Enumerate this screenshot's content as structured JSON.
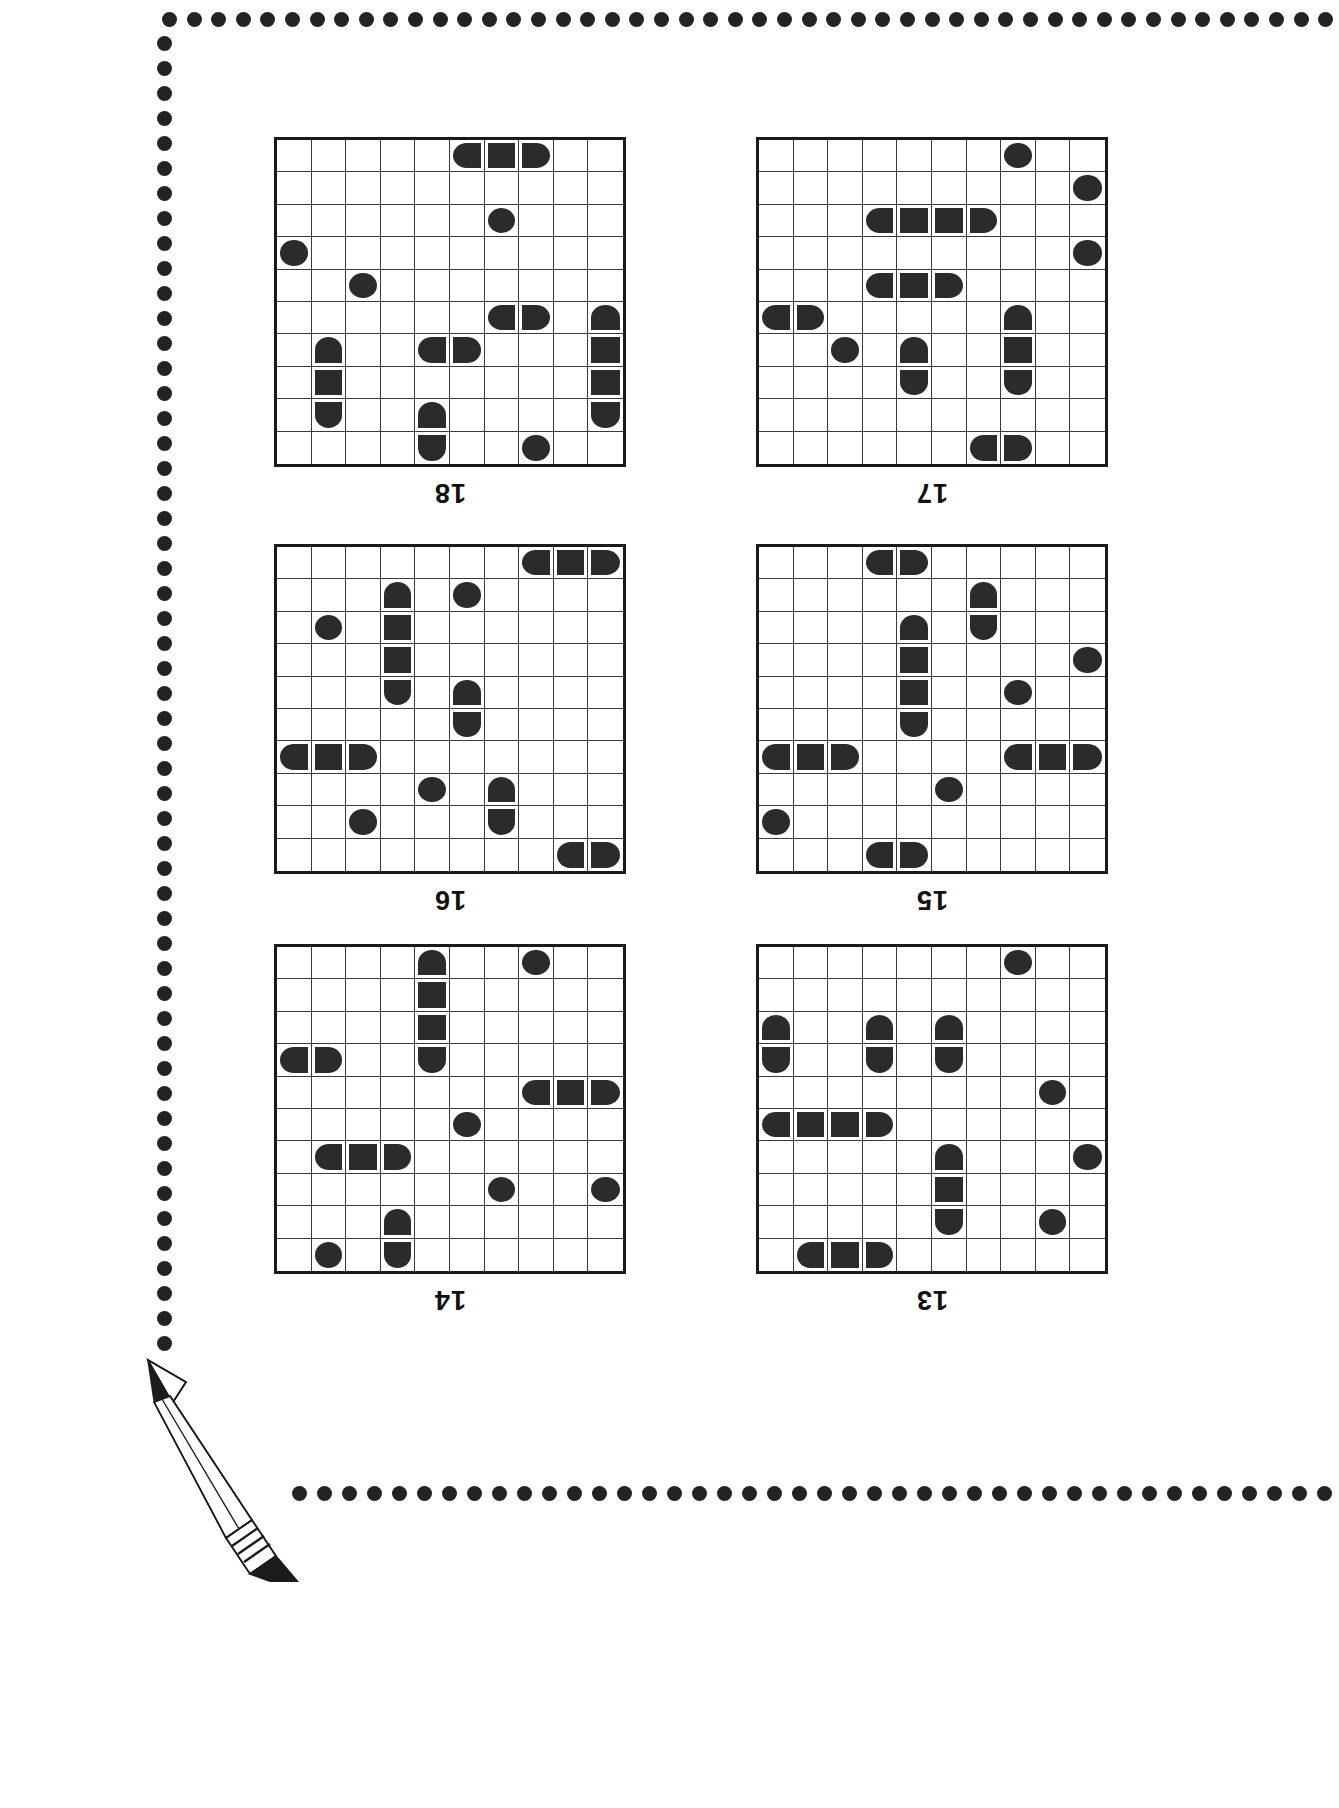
{
  "page": {
    "type": "battleship-puzzle-worksheet",
    "background_color": "#ffffff",
    "ink_color": "#2b2b2b",
    "border_style": "dotted-circles",
    "border_dot_color": "#232323",
    "decoration": "pencil-illustration-bottom-left",
    "grid_columns": 10,
    "grid_rows": 10,
    "labels_rotated_180": true
  },
  "puzzles": [
    {
      "id": "puzzle-18",
      "label": "18",
      "position": "top-left",
      "ships": [
        {
          "cells": [
            [
              0,
              5
            ],
            [
              0,
              6
            ],
            [
              0,
              7
            ]
          ],
          "orientation": "horizontal",
          "size": 3
        },
        {
          "cells": [
            [
              2,
              6
            ]
          ],
          "orientation": "single",
          "size": 1
        },
        {
          "cells": [
            [
              3,
              0
            ]
          ],
          "orientation": "single",
          "size": 1
        },
        {
          "cells": [
            [
              4,
              2
            ]
          ],
          "orientation": "single",
          "size": 1
        },
        {
          "cells": [
            [
              5,
              6
            ],
            [
              5,
              7
            ]
          ],
          "orientation": "horizontal",
          "size": 2
        },
        {
          "cells": [
            [
              5,
              9
            ],
            [
              6,
              9
            ],
            [
              7,
              9
            ],
            [
              8,
              9
            ]
          ],
          "orientation": "vertical",
          "size": 4
        },
        {
          "cells": [
            [
              6,
              1
            ],
            [
              7,
              1
            ],
            [
              8,
              1
            ]
          ],
          "orientation": "vertical",
          "size": 3
        },
        {
          "cells": [
            [
              6,
              4
            ],
            [
              6,
              5
            ]
          ],
          "orientation": "horizontal",
          "size": 2
        },
        {
          "cells": [
            [
              8,
              4
            ],
            [
              9,
              4
            ]
          ],
          "orientation": "vertical",
          "size": 2
        },
        {
          "cells": [
            [
              9,
              7
            ]
          ],
          "orientation": "single",
          "size": 1
        }
      ]
    },
    {
      "id": "puzzle-17",
      "label": "17",
      "position": "top-right",
      "ships": [
        {
          "cells": [
            [
              0,
              7
            ]
          ],
          "orientation": "single",
          "size": 1
        },
        {
          "cells": [
            [
              1,
              9
            ]
          ],
          "orientation": "single",
          "size": 1
        },
        {
          "cells": [
            [
              2,
              3
            ],
            [
              2,
              4
            ],
            [
              2,
              5
            ],
            [
              2,
              6
            ]
          ],
          "orientation": "horizontal",
          "size": 4
        },
        {
          "cells": [
            [
              3,
              9
            ]
          ],
          "orientation": "single",
          "size": 1
        },
        {
          "cells": [
            [
              4,
              3
            ],
            [
              4,
              4
            ],
            [
              4,
              5
            ]
          ],
          "orientation": "horizontal",
          "size": 3
        },
        {
          "cells": [
            [
              5,
              0
            ],
            [
              5,
              1
            ]
          ],
          "orientation": "horizontal",
          "size": 2
        },
        {
          "cells": [
            [
              5,
              7
            ],
            [
              6,
              7
            ],
            [
              7,
              7
            ]
          ],
          "orientation": "vertical",
          "size": 3
        },
        {
          "cells": [
            [
              6,
              2
            ]
          ],
          "orientation": "single",
          "size": 1
        },
        {
          "cells": [
            [
              6,
              4
            ],
            [
              7,
              4
            ]
          ],
          "orientation": "vertical",
          "size": 2
        },
        {
          "cells": [
            [
              9,
              6
            ],
            [
              9,
              7
            ]
          ],
          "orientation": "horizontal",
          "size": 2
        }
      ]
    },
    {
      "id": "puzzle-16",
      "label": "16",
      "position": "middle-left",
      "ships": [
        {
          "cells": [
            [
              0,
              7
            ],
            [
              0,
              8
            ],
            [
              0,
              9
            ]
          ],
          "orientation": "horizontal",
          "size": 3
        },
        {
          "cells": [
            [
              1,
              3
            ],
            [
              2,
              3
            ],
            [
              3,
              3
            ],
            [
              4,
              3
            ]
          ],
          "orientation": "vertical",
          "size": 4
        },
        {
          "cells": [
            [
              1,
              5
            ]
          ],
          "orientation": "single",
          "size": 1
        },
        {
          "cells": [
            [
              2,
              1
            ]
          ],
          "orientation": "single",
          "size": 1
        },
        {
          "cells": [
            [
              4,
              5
            ],
            [
              5,
              5
            ]
          ],
          "orientation": "vertical",
          "size": 2
        },
        {
          "cells": [
            [
              6,
              0
            ],
            [
              6,
              1
            ],
            [
              6,
              2
            ]
          ],
          "orientation": "horizontal",
          "size": 3
        },
        {
          "cells": [
            [
              7,
              4
            ]
          ],
          "orientation": "single",
          "size": 1
        },
        {
          "cells": [
            [
              7,
              6
            ],
            [
              8,
              6
            ]
          ],
          "orientation": "vertical",
          "size": 2
        },
        {
          "cells": [
            [
              8,
              2
            ]
          ],
          "orientation": "single",
          "size": 1
        },
        {
          "cells": [
            [
              9,
              8
            ],
            [
              9,
              9
            ]
          ],
          "orientation": "horizontal",
          "size": 2
        }
      ]
    },
    {
      "id": "puzzle-15",
      "label": "15",
      "position": "middle-right",
      "ships": [
        {
          "cells": [
            [
              0,
              3
            ],
            [
              0,
              4
            ]
          ],
          "orientation": "horizontal",
          "size": 2
        },
        {
          "cells": [
            [
              1,
              6
            ],
            [
              2,
              6
            ]
          ],
          "orientation": "vertical",
          "size": 2
        },
        {
          "cells": [
            [
              2,
              4
            ],
            [
              3,
              4
            ],
            [
              4,
              4
            ],
            [
              5,
              4
            ]
          ],
          "orientation": "vertical",
          "size": 4
        },
        {
          "cells": [
            [
              3,
              9
            ]
          ],
          "orientation": "single",
          "size": 1
        },
        {
          "cells": [
            [
              4,
              7
            ]
          ],
          "orientation": "single",
          "size": 1
        },
        {
          "cells": [
            [
              6,
              0
            ],
            [
              6,
              1
            ],
            [
              6,
              2
            ]
          ],
          "orientation": "horizontal",
          "size": 3
        },
        {
          "cells": [
            [
              6,
              7
            ],
            [
              6,
              8
            ],
            [
              6,
              9
            ]
          ],
          "orientation": "horizontal",
          "size": 3
        },
        {
          "cells": [
            [
              7,
              5
            ]
          ],
          "orientation": "single",
          "size": 1
        },
        {
          "cells": [
            [
              8,
              0
            ]
          ],
          "orientation": "single",
          "size": 1
        },
        {
          "cells": [
            [
              9,
              3
            ],
            [
              9,
              4
            ]
          ],
          "orientation": "horizontal",
          "size": 2
        }
      ]
    },
    {
      "id": "puzzle-14",
      "label": "14",
      "position": "bottom-left",
      "ships": [
        {
          "cells": [
            [
              0,
              4
            ],
            [
              1,
              4
            ],
            [
              2,
              4
            ],
            [
              3,
              4
            ]
          ],
          "orientation": "vertical",
          "size": 4
        },
        {
          "cells": [
            [
              0,
              7
            ]
          ],
          "orientation": "single",
          "size": 1
        },
        {
          "cells": [
            [
              3,
              0
            ],
            [
              3,
              1
            ]
          ],
          "orientation": "horizontal",
          "size": 2
        },
        {
          "cells": [
            [
              4,
              7
            ],
            [
              4,
              8
            ],
            [
              4,
              9
            ]
          ],
          "orientation": "horizontal",
          "size": 3
        },
        {
          "cells": [
            [
              5,
              5
            ]
          ],
          "orientation": "single",
          "size": 1
        },
        {
          "cells": [
            [
              6,
              1
            ],
            [
              6,
              2
            ],
            [
              6,
              3
            ]
          ],
          "orientation": "horizontal",
          "size": 3
        },
        {
          "cells": [
            [
              7,
              6
            ]
          ],
          "orientation": "single",
          "size": 1
        },
        {
          "cells": [
            [
              7,
              9
            ]
          ],
          "orientation": "single",
          "size": 1
        },
        {
          "cells": [
            [
              8,
              3
            ],
            [
              9,
              3
            ]
          ],
          "orientation": "vertical",
          "size": 2
        },
        {
          "cells": [
            [
              9,
              1
            ]
          ],
          "orientation": "single",
          "size": 1
        }
      ]
    },
    {
      "id": "puzzle-13",
      "label": "13",
      "position": "bottom-right",
      "ships": [
        {
          "cells": [
            [
              0,
              7
            ]
          ],
          "orientation": "single",
          "size": 1
        },
        {
          "cells": [
            [
              2,
              0
            ],
            [
              3,
              0
            ]
          ],
          "orientation": "vertical",
          "size": 2
        },
        {
          "cells": [
            [
              2,
              3
            ],
            [
              3,
              3
            ]
          ],
          "orientation": "vertical",
          "size": 2
        },
        {
          "cells": [
            [
              2,
              5
            ],
            [
              3,
              5
            ]
          ],
          "orientation": "vertical",
          "size": 2
        },
        {
          "cells": [
            [
              4,
              8
            ]
          ],
          "orientation": "single",
          "size": 1
        },
        {
          "cells": [
            [
              5,
              0
            ],
            [
              5,
              1
            ],
            [
              5,
              2
            ],
            [
              5,
              3
            ]
          ],
          "orientation": "horizontal",
          "size": 4
        },
        {
          "cells": [
            [
              6,
              5
            ],
            [
              7,
              5
            ],
            [
              8,
              5
            ]
          ],
          "orientation": "vertical",
          "size": 3
        },
        {
          "cells": [
            [
              6,
              9
            ]
          ],
          "orientation": "single",
          "size": 1
        },
        {
          "cells": [
            [
              8,
              8
            ]
          ],
          "orientation": "single",
          "size": 1
        },
        {
          "cells": [
            [
              9,
              1
            ],
            [
              9,
              2
            ],
            [
              9,
              3
            ]
          ],
          "orientation": "horizontal",
          "size": 3
        }
      ]
    }
  ],
  "icons": {
    "pencil": "pencil-icon",
    "dot": "border-dot-icon"
  }
}
